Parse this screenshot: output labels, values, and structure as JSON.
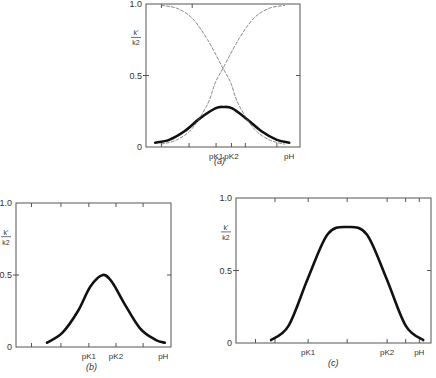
{
  "figure": {
    "caption_fragment": "",
    "panels_labels": [
      "(a)",
      "(b)",
      "(c)"
    ]
  },
  "chart_data": [
    {
      "panel": "(a)",
      "type": "line",
      "title": "",
      "xlabel": "pH",
      "ylabel": "k'/k2",
      "ylabel_num": "k'",
      "ylabel_den": "k2",
      "ylim": [
        0,
        1.0
      ],
      "yticks": [
        "0",
        "0.5",
        "1.0"
      ],
      "xtick_labels": [
        {
          "label": "pK1",
          "pos": 0.455
        },
        {
          "label": "pK2",
          "pos": 0.555
        },
        {
          "label": "pH",
          "pos": 0.93
        }
      ],
      "grid": false,
      "series": [
        {
          "name": "k'/k2 (bell)",
          "style": "bold",
          "x": [
            0.06,
            0.15,
            0.25,
            0.35,
            0.45,
            0.505,
            0.56,
            0.65,
            0.75,
            0.85,
            0.93
          ],
          "y": [
            0.03,
            0.05,
            0.11,
            0.2,
            0.27,
            0.28,
            0.27,
            0.2,
            0.11,
            0.05,
            0.03
          ]
        },
        {
          "name": "acid form fraction",
          "style": "dashed",
          "x": [
            0.1,
            0.2,
            0.3,
            0.4,
            0.5,
            0.55,
            0.6,
            0.7,
            0.8,
            0.9
          ],
          "y": [
            0.99,
            0.97,
            0.9,
            0.75,
            0.55,
            0.45,
            0.3,
            0.13,
            0.05,
            0.02
          ]
        },
        {
          "name": "base form fraction",
          "style": "dashed",
          "x": [
            0.1,
            0.2,
            0.3,
            0.4,
            0.45,
            0.5,
            0.6,
            0.7,
            0.8,
            0.9
          ],
          "y": [
            0.02,
            0.05,
            0.13,
            0.3,
            0.45,
            0.55,
            0.75,
            0.9,
            0.97,
            0.99
          ]
        }
      ]
    },
    {
      "panel": "(b)",
      "type": "line",
      "title": "",
      "xlabel": "pH",
      "ylabel": "k'/k2",
      "ylabel_num": "k'",
      "ylabel_den": "k2",
      "ylim": [
        0,
        1.0
      ],
      "yticks": [
        "0",
        "0.5",
        "1.0"
      ],
      "xtick_labels": [
        {
          "label": "pK1",
          "pos": 0.47
        },
        {
          "label": "pK2",
          "pos": 0.645
        },
        {
          "label": "pH",
          "pos": 0.95
        }
      ],
      "grid": false,
      "series": [
        {
          "name": "k'/k2",
          "style": "bold",
          "x": [
            0.2,
            0.3,
            0.4,
            0.48,
            0.56,
            0.62,
            0.7,
            0.8,
            0.9,
            0.96
          ],
          "y": [
            0.03,
            0.1,
            0.25,
            0.42,
            0.5,
            0.45,
            0.3,
            0.13,
            0.05,
            0.03
          ]
        }
      ]
    },
    {
      "panel": "(c)",
      "type": "line",
      "title": "",
      "xlabel": "pH",
      "ylabel": "k'/k2",
      "ylabel_num": "k'",
      "ylabel_den": "k2",
      "ylim": [
        0,
        1.0
      ],
      "yticks": [
        "0",
        "0.5",
        "1.0"
      ],
      "xtick_labels": [
        {
          "label": "pK1",
          "pos": 0.37
        },
        {
          "label": "pK2",
          "pos": 0.775
        },
        {
          "label": "pH",
          "pos": 0.94
        }
      ],
      "grid": false,
      "series": [
        {
          "name": "k'/k2",
          "style": "bold",
          "x": [
            0.18,
            0.27,
            0.37,
            0.47,
            0.57,
            0.67,
            0.77,
            0.87,
            0.96
          ],
          "y": [
            0.02,
            0.12,
            0.45,
            0.75,
            0.8,
            0.75,
            0.45,
            0.12,
            0.02
          ]
        }
      ]
    }
  ],
  "layout": {
    "panels": [
      {
        "x0": 146,
        "y0": 4,
        "x1": 300,
        "y1": 147,
        "topticks": [
          0.1,
          0.3
        ],
        "bottomticks": [
          0.1,
          0.28,
          0.455,
          0.555,
          0.645,
          0.85
        ],
        "rightticks": [
          0.5
        ]
      },
      {
        "x0": 16,
        "y0": 203,
        "x1": 171,
        "y1": 347,
        "topticks": [
          0.1,
          0.29,
          0.47,
          0.645,
          0.82
        ],
        "bottomticks": [
          0.1,
          0.29,
          0.47,
          0.645,
          0.82
        ],
        "rightticks": [
          0.5
        ]
      },
      {
        "x0": 236,
        "y0": 198,
        "x1": 431,
        "y1": 343,
        "topticks": [
          0.2,
          0.37,
          0.57,
          0.775,
          0.87,
          0.94
        ],
        "bottomticks": [
          0.1,
          0.2,
          0.37,
          0.57,
          0.775,
          0.87,
          0.94
        ],
        "rightticks": [
          0.5
        ]
      }
    ]
  }
}
